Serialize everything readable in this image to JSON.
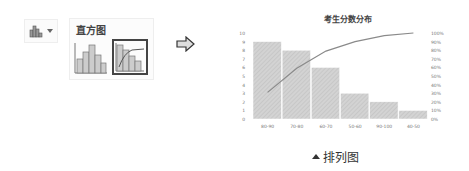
{
  "toolbar": {
    "chart_button_icon": "histogram-chart-icon",
    "dropdown_icon": "chevron-down-icon"
  },
  "gallery": {
    "title": "直方图",
    "items": [
      {
        "name": "histogram",
        "selected": false
      },
      {
        "name": "pareto",
        "selected": true
      }
    ]
  },
  "arrow_icon": "right-arrow-icon",
  "caption": {
    "icon": "triangle-up-icon",
    "text": "排列图"
  },
  "chart_data": {
    "type": "bar",
    "title": "考生分数分布",
    "categories": [
      "80-90",
      "70-80",
      "60-70",
      "50-60",
      "90-100",
      "40-50"
    ],
    "series": [
      {
        "name": "count",
        "type": "bar",
        "axis": "left",
        "values": [
          9,
          8,
          6,
          3,
          2,
          1
        ]
      },
      {
        "name": "cumulative %",
        "type": "line",
        "axis": "right",
        "values": [
          31,
          59,
          79,
          90,
          97,
          100
        ]
      }
    ],
    "yticks_left": [
      "0",
      "1",
      "2",
      "3",
      "4",
      "5",
      "6",
      "7",
      "8",
      "9",
      "10"
    ],
    "yticks_right": [
      "0%",
      "10%",
      "20%",
      "30%",
      "40%",
      "50%",
      "60%",
      "70%",
      "80%",
      "90%",
      "100%"
    ],
    "ylim_left": [
      0,
      10
    ],
    "ylim_right": [
      0,
      100
    ],
    "xlabel": "",
    "ylabel": "",
    "grid": false,
    "legend": "none",
    "colors": {
      "bar": "#d0d0d0",
      "bar_hatch": "#b8b8b8",
      "line": "#8a8a8a"
    }
  }
}
